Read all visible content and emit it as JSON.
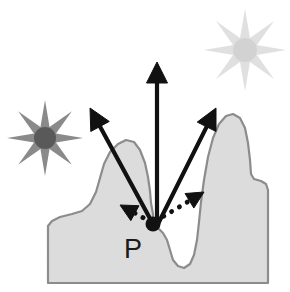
{
  "figure": {
    "type": "diagram",
    "background_color": "#ffffff",
    "width": 290,
    "height": 292
  },
  "terrain": {
    "name": "surface-cross-section",
    "fill_color": "#dcdcdc",
    "stroke_color": "#8c8c8c",
    "stroke_width": 2.2,
    "description": "Rough terrain cross-section with a left hill, a central shallow basin containing point P, a deep narrow valley, and a tall right hill with a stepped shoulder",
    "path": "M 48 283 L 48 226 L 52 221 L 60 217 L 72 214 L 82 211 L 90 204 L 96 192 L 100 178 L 104 164 L 110 152 L 118 144 L 126 140 L 134 142 L 140 150 L 145 163 L 148 177 L 150 191 L 151 203 L 153 214 L 153 224 L 158 228 L 163 233 L 167 240 L 170 250 L 173 260 L 178 266 L 184 268 L 190 264 L 194 255 L 197 240 L 199 222 L 201 202 L 204 180 L 208 157 L 213 138 L 219 124 L 226 116 L 233 114 L 240 118 L 245 128 L 248 143 L 250 160 L 251 174 L 254 179 L 261 181 L 266 184 L 268 190 L 268 283 Z"
  },
  "point_p": {
    "label": "P",
    "label_x": 124,
    "label_y": 258,
    "dot_x": 153,
    "dot_y": 224,
    "dot_radius": 7.5,
    "dot_color": "#111111"
  },
  "suns": [
    {
      "name": "sun-left-dark",
      "cx": 45,
      "cy": 138,
      "core_radius": 11,
      "ray_length": 27,
      "ray_count": 8,
      "color": "#595959",
      "ray_color": "#8a8a8a"
    },
    {
      "name": "sun-right-light",
      "cx": 245,
      "cy": 50,
      "core_radius": 12,
      "ray_length": 29,
      "ray_count": 8,
      "color": "#d2d2d2",
      "ray_color": "#e0e0e0"
    }
  ],
  "outgoing_rays": {
    "style": "solid",
    "color": "#111111",
    "line_width": 4.2,
    "arrows": [
      {
        "name": "outgoing-ray-upper-left",
        "x1": 153,
        "y1": 224,
        "x2": 90,
        "y2": 108,
        "direction": "up-left"
      },
      {
        "name": "outgoing-ray-vertical",
        "x1": 157,
        "y1": 224,
        "x2": 157,
        "y2": 62,
        "direction": "up"
      },
      {
        "name": "outgoing-ray-upper-right",
        "x1": 158,
        "y1": 224,
        "x2": 216,
        "y2": 108,
        "direction": "up-right"
      }
    ]
  },
  "incoming_rays": {
    "style": "dotted",
    "color": "#111111",
    "line_width": 4.2,
    "dot_pattern": "0.1 9",
    "arrows": [
      {
        "name": "incoming-ray-left-dotted",
        "x1": 151,
        "y1": 222,
        "x2": 120,
        "y2": 205,
        "direction": "up-left"
      },
      {
        "name": "incoming-ray-right-dotted",
        "x1": 156,
        "y1": 221,
        "x2": 204,
        "y2": 192,
        "direction": "up-right"
      }
    ]
  }
}
